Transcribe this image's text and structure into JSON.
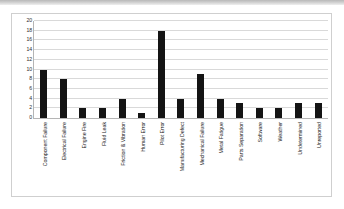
{
  "chart_data": {
    "type": "bar",
    "title": "",
    "subtitle": "",
    "xlabel": "",
    "ylabel": "",
    "ylim": [
      0,
      20
    ],
    "ytick_step": 2,
    "yticks": [
      "0",
      "2",
      "4",
      "6",
      "8",
      "10",
      "12",
      "14",
      "16",
      "18",
      "20"
    ],
    "grid": true,
    "legend": false,
    "legend_position": "none",
    "bar_color": "#141414",
    "gridline_color": "#d9d9d9",
    "axis_color": "#b5b5b5",
    "categories": [
      "Component Failure",
      "Electrical Failure",
      "Engine Fire",
      "Fluid Leak",
      "Friction & Vibration",
      "Human Error",
      "Pilot Error",
      "Manufacturing Defect",
      "Mechanical Failure",
      "Metal Fatigue",
      "Parts Separation",
      "Software",
      "Weather",
      "Undetermined",
      "Unreported"
    ],
    "values": [
      10,
      8,
      2,
      2,
      4,
      1,
      18,
      4,
      9,
      4,
      3,
      2,
      2,
      3,
      3
    ]
  }
}
